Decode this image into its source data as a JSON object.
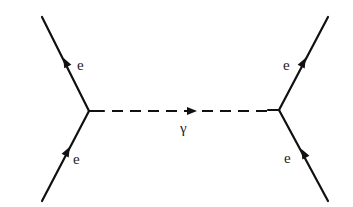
{
  "diagram": {
    "type": "feynman",
    "left_vertex": {
      "incoming": {
        "particle": "e",
        "label": "e"
      },
      "outgoing": {
        "particle": "e",
        "label": "e"
      }
    },
    "right_vertex": {
      "incoming": {
        "particle": "e",
        "label": "e"
      },
      "outgoing": {
        "particle": "e",
        "label": "e"
      }
    },
    "propagator": {
      "particle": "photon",
      "label": "γ",
      "style": "dashed",
      "direction": "left-to-right"
    }
  }
}
